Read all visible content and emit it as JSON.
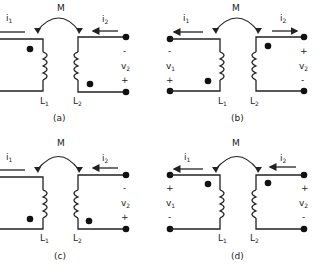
{
  "figure": {
    "panels": [
      {
        "id": "a",
        "caption": "(a)",
        "mutual_label": "M",
        "i1": {
          "label": "i",
          "sub": "1",
          "direction": "none"
        },
        "i2": {
          "label": "i",
          "sub": "2",
          "direction": "left"
        },
        "L1": {
          "label": "L",
          "sub": "1"
        },
        "L2": {
          "label": "L",
          "sub": "2"
        },
        "left_terminals": false,
        "right_terminals": true,
        "v1": null,
        "v2": {
          "label": "v",
          "sub": "2",
          "top": "-",
          "bottom": "+"
        },
        "dot_L1": "top",
        "dot_L2": "bottom"
      },
      {
        "id": "b",
        "caption": "(b)",
        "mutual_label": "M",
        "i1": {
          "label": "i",
          "sub": "1",
          "direction": "left"
        },
        "i2": {
          "label": "i",
          "sub": "2",
          "direction": "right"
        },
        "L1": {
          "label": "L",
          "sub": "1"
        },
        "L2": {
          "label": "L",
          "sub": "2"
        },
        "left_terminals": true,
        "right_terminals": true,
        "v1": {
          "label": "v",
          "sub": "1",
          "top": "-",
          "bottom": "+"
        },
        "v2": {
          "label": "v",
          "sub": "2",
          "top": "+",
          "bottom": "-"
        },
        "dot_L1": "bottom",
        "dot_L2": "top"
      },
      {
        "id": "c",
        "caption": "(c)",
        "mutual_label": "M",
        "i1": {
          "label": "i",
          "sub": "1",
          "direction": "none"
        },
        "i2": {
          "label": "i",
          "sub": "2",
          "direction": "left"
        },
        "L1": {
          "label": "L",
          "sub": "1"
        },
        "L2": {
          "label": "L",
          "sub": "2"
        },
        "left_terminals": false,
        "right_terminals": true,
        "v1": null,
        "v2": {
          "label": "v",
          "sub": "2",
          "top": "-",
          "bottom": "+"
        },
        "dot_L1": "bottom",
        "dot_L2": "bottom"
      },
      {
        "id": "d",
        "caption": "(d)",
        "mutual_label": "M",
        "i1": {
          "label": "i",
          "sub": "1",
          "direction": "left"
        },
        "i2": {
          "label": "i",
          "sub": "2",
          "direction": "left"
        },
        "L1": {
          "label": "L",
          "sub": "1"
        },
        "L2": {
          "label": "L",
          "sub": "2"
        },
        "left_terminals": true,
        "right_terminals": true,
        "v1": {
          "label": "v",
          "sub": "1",
          "top": "+",
          "bottom": "-"
        },
        "v2": {
          "label": "v",
          "sub": "2",
          "top": "+",
          "bottom": "-"
        },
        "dot_L1": "top",
        "dot_L2": "top"
      }
    ]
  }
}
